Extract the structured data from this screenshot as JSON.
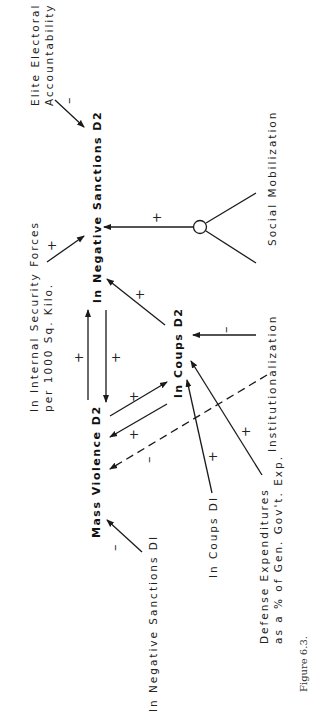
{
  "figure": {
    "caption": "Figure 6.3.",
    "orientation": "rotated -90deg (landscape page shown portrait)"
  },
  "nodes": {
    "elite_accountability": {
      "line1": "Elite Electoral",
      "line2": "Accountability"
    },
    "neg_sanctions_d2": {
      "label": "ln Negative Sanctions D2"
    },
    "internal_security": {
      "line1": "ln Internal Security Forces",
      "line2": "per 1000 Sq. Kilo."
    },
    "social_mobilization": {
      "label": "Social Mobilization"
    },
    "institutionalization": {
      "label": "Institutionalization"
    },
    "coups_d2": {
      "label": "ln Coups D2"
    },
    "mass_violence_d2": {
      "label": "Mass Violence D2"
    },
    "neg_sanctions_d1": {
      "label": "ln Negative Sanctions DI"
    },
    "coups_d1": {
      "label": "ln Coups DI"
    },
    "defense_exp": {
      "line1": "Defense Expenditures",
      "line2": "as a % of Gen. Gov't. Exp."
    }
  },
  "edges": [
    {
      "from": "Elite Electoral Accountability",
      "to": "ln Negative Sanctions D2",
      "sign": "–",
      "style": "solid"
    },
    {
      "from": "ln Internal Security Forces per 1000 Sq. Kilo.",
      "to": "ln Negative Sanctions D2",
      "sign": "+",
      "style": "solid"
    },
    {
      "from": "Social Mobilization × Institutionalization (interaction)",
      "to": "ln Negative Sanctions D2",
      "sign": "+",
      "style": "solid"
    },
    {
      "from": "ln Coups D2",
      "to": "ln Negative Sanctions D2",
      "sign": "+",
      "style": "solid"
    },
    {
      "from": "Mass Violence D2",
      "to": "ln Negative Sanctions D2",
      "sign": "+",
      "style": "solid"
    },
    {
      "from": "ln Negative Sanctions D2",
      "to": "Mass Violence D2",
      "sign": "+",
      "style": "solid"
    },
    {
      "from": "Institutionalization",
      "to": "ln Coups D2",
      "sign": "–",
      "style": "solid"
    },
    {
      "from": "Mass Violence D2",
      "to": "ln Coups D2",
      "sign": "+",
      "style": "solid"
    },
    {
      "from": "ln Coups D2",
      "to": "Mass Violence D2",
      "sign": "+",
      "style": "solid"
    },
    {
      "from": "Institutionalization",
      "to": "Mass Violence D2",
      "sign": "–",
      "style": "dashed"
    },
    {
      "from": "ln Coups DI",
      "to": "ln Coups D2",
      "sign": "+",
      "style": "solid"
    },
    {
      "from": "Defense Expenditures as a % of Gen. Gov't. Exp.",
      "to": "ln Coups D2",
      "sign": "+",
      "style": "solid"
    },
    {
      "from": "ln Negative Sanctions DI",
      "to": "Mass Violence D2",
      "sign": "–",
      "style": "solid"
    }
  ],
  "signs": {
    "plus": "+",
    "minus": "–"
  },
  "colors": {
    "ink": "#1a1a1a",
    "background": "#ffffff"
  }
}
